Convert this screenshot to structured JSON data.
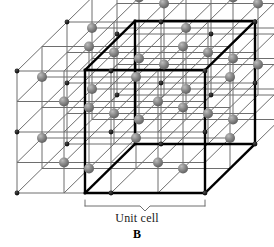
{
  "figure": {
    "type": "crystal-lattice-diagram",
    "lattice_type": "face-centered cubic",
    "panel_letter": "B",
    "unit_cell_caption": "Unit cell",
    "background_color": "#ffffff",
    "colors": {
      "sphere_gray": "#8a8a8a",
      "sphere_gray_highlight": "#b5b5b5",
      "sphere_gray_shadow": "#5f5f5f",
      "corner_dot_black": "#1a1a1a",
      "thin_line": "#6e6e6e",
      "bold_line": "#000000",
      "bracket_line": "#6e6e6e",
      "text_color": "#1a1a1a"
    },
    "geometry": {
      "cell_width": 94,
      "cell_height": 61,
      "depth_dx": 50,
      "depth_dy": -49,
      "origin_x": 17,
      "origin_y": 193,
      "layers": 3,
      "cols": 3,
      "rows": 3,
      "sphere_radius": 5,
      "corner_dot_radius": 2.4,
      "thin_line_width": 1,
      "bold_line_width": 2.4
    },
    "unit_cell_bold_cube": {
      "front_bottom_left_x": 85,
      "front_bottom_left_y": 193,
      "front_top_left_x": 85,
      "front_top_left_y": 70,
      "front_bottom_right_x": 205,
      "front_bottom_right_y": 193,
      "front_top_right_x": 205,
      "front_top_right_y": 70
    },
    "bracket": {
      "left_x": 85,
      "right_x": 205,
      "y": 200,
      "tick_height": 6,
      "center_notch_depth": 5
    }
  },
  "chart_data": {
    "type": "diagram",
    "annotations": [
      "Unit cell",
      "B"
    ],
    "legend": [
      {
        "marker": "gray-sphere",
        "meaning": "face-center lattice point",
        "color": "#8a8a8a"
      },
      {
        "marker": "black-dot",
        "meaning": "cube-corner lattice point",
        "color": "#1a1a1a"
      }
    ]
  }
}
